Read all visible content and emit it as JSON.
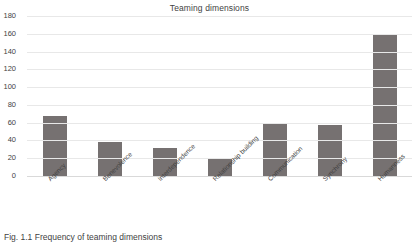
{
  "figure": {
    "caption": "Fig. 1.1 Frequency of teaming dimensions"
  },
  "chart_data": {
    "type": "bar",
    "title": "Teaming dimensions",
    "xlabel": "",
    "ylabel": "",
    "ylim": [
      0,
      180
    ],
    "yticks": [
      0,
      20,
      40,
      60,
      80,
      100,
      120,
      140,
      160,
      180
    ],
    "grid": true,
    "legend": "none",
    "bar_color": "#767171",
    "categories": [
      "Agency",
      "Benevolence",
      "Interdependence",
      "Relationship  building",
      "Communication",
      "Synchrony",
      "Humanness"
    ],
    "values": [
      68,
      38,
      32,
      19,
      59,
      57,
      159
    ]
  }
}
